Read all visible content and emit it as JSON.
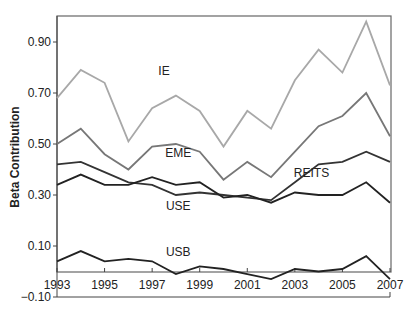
{
  "chart_data": {
    "type": "line",
    "title": "",
    "xlabel": "",
    "ylabel": "Beta Contribution",
    "ylim": [
      -0.1,
      1.0
    ],
    "xlim": [
      1993,
      2007
    ],
    "grid": false,
    "legend": "inline labels",
    "x": [
      1993,
      1994,
      1995,
      1996,
      1997,
      1998,
      1999,
      2000,
      2001,
      2002,
      2003,
      2004,
      2005,
      2006,
      2007
    ],
    "x_tick_labels": [
      "1993",
      "1995",
      "1997",
      "1999",
      "2001",
      "2003",
      "2005",
      "2007"
    ],
    "y_tick_labels": [
      "0.90",
      "0.70",
      "0.50",
      "0.30",
      "0.10",
      "−0.10"
    ],
    "y_ticks": [
      0.9,
      0.7,
      0.5,
      0.3,
      0.1,
      -0.1
    ],
    "series": [
      {
        "name": "IE",
        "color": "#a8a8a8",
        "label_pos": [
          1997.5,
          0.77
        ],
        "values": [
          0.68,
          0.79,
          0.74,
          0.51,
          0.64,
          0.69,
          0.63,
          0.49,
          0.63,
          0.56,
          0.75,
          0.87,
          0.78,
          0.98,
          0.73
        ]
      },
      {
        "name": "EME",
        "color": "#777777",
        "label_pos": [
          1998.1,
          0.45
        ],
        "values": [
          0.5,
          0.56,
          0.46,
          0.4,
          0.49,
          0.5,
          0.47,
          0.36,
          0.43,
          0.37,
          0.47,
          0.57,
          0.61,
          0.7,
          0.53
        ]
      },
      {
        "name": "REITS",
        "color": "#333333",
        "label_pos": [
          2003.7,
          0.37
        ],
        "values": [
          0.42,
          0.43,
          0.39,
          0.35,
          0.34,
          0.3,
          0.31,
          0.3,
          0.29,
          0.28,
          0.35,
          0.42,
          0.43,
          0.47,
          0.43
        ]
      },
      {
        "name": "USE",
        "color": "#222222",
        "label_pos": [
          1998.1,
          0.24
        ],
        "values": [
          0.34,
          0.38,
          0.34,
          0.34,
          0.37,
          0.34,
          0.35,
          0.29,
          0.3,
          0.27,
          0.31,
          0.3,
          0.3,
          0.35,
          0.27
        ]
      },
      {
        "name": "USB",
        "color": "#222222",
        "label_pos": [
          1998.1,
          0.06
        ],
        "values": [
          0.04,
          0.08,
          0.04,
          0.05,
          0.04,
          -0.01,
          0.02,
          0.01,
          -0.01,
          -0.03,
          0.01,
          0.0,
          0.01,
          0.06,
          -0.03
        ]
      }
    ]
  }
}
